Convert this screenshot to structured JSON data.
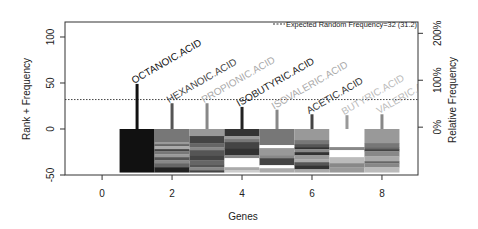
{
  "chart_data": {
    "type": "bar",
    "subtype": "lollipop with striped blocks",
    "title": "",
    "xlabel": "Genes",
    "ylabel": "Rank + Frequency",
    "ylabel_right": "Relative Frequency",
    "xlim": [
      -1.06,
      9.03
    ],
    "ylim": [
      -50,
      116.3
    ],
    "xticks": [
      0,
      2,
      4,
      6,
      8
    ],
    "yticks": [
      -50,
      0,
      50,
      100
    ],
    "yticks_right": [
      {
        "label": "0%",
        "at": 2
      },
      {
        "label": "100%",
        "at": 53
      },
      {
        "label": "200%",
        "at": 104
      }
    ],
    "grid": false,
    "legend_position": "top-right",
    "reference_line": {
      "label": "Expected Random Frequency=32 (31.2)",
      "value": 32,
      "style": "dotted"
    },
    "categories": [
      "OCTANOIC.ACID",
      "HEXANOIC.ACID",
      "PROPIONIC.ACID",
      "ISOBUTYRIC.ACID",
      "ISOVALERIC.ACID",
      "ACETIC.ACID",
      "BUTYRIC.ACID",
      "VALERIC.ACID"
    ],
    "x": [
      1,
      2,
      3,
      4,
      5,
      6,
      7,
      8
    ],
    "values": [
      49,
      28,
      28,
      24,
      21,
      16,
      15,
      16
    ],
    "stick_colors": [
      "#111111",
      "#555555",
      "#888888",
      "#222222",
      "#888888",
      "#444444",
      "#999999",
      "#888888"
    ],
    "label_colors": [
      "#111111",
      "#444444",
      "#aaaaaa",
      "#222222",
      "#aaaaaa",
      "#333333",
      "#bbbbbb",
      "#bbbbbb"
    ],
    "block_bottom": -47,
    "blocks": [
      [
        {
          "color": "#111111",
          "h": 43
        }
      ],
      [
        {
          "color": "#777777",
          "h": 13
        },
        {
          "color": "#999999",
          "h": 2
        },
        {
          "color": "#666666",
          "h": 2
        },
        {
          "color": "#aaaaaa",
          "h": 3
        },
        {
          "color": "#444444",
          "h": 2
        },
        {
          "color": "#777777",
          "h": 3
        },
        {
          "color": "#999999",
          "h": 3
        },
        {
          "color": "#555555",
          "h": 3
        },
        {
          "color": "#888888",
          "h": 3
        },
        {
          "color": "#666666",
          "h": 4
        },
        {
          "color": "#222222",
          "h": 5
        }
      ],
      [
        {
          "color": "#999999",
          "h": 7
        },
        {
          "color": "#444444",
          "h": 7
        },
        {
          "color": "#666666",
          "h": 4
        },
        {
          "color": "#888888",
          "h": 3
        },
        {
          "color": "#555555",
          "h": 5
        },
        {
          "color": "#444444",
          "h": 5
        },
        {
          "color": "#666666",
          "h": 4
        },
        {
          "color": "#555555",
          "h": 3
        },
        {
          "color": "#888888",
          "h": 3
        },
        {
          "color": "#444444",
          "h": 2
        }
      ],
      [
        {
          "color": "#333333",
          "h": 7
        },
        {
          "color": "#999999",
          "h": 3
        },
        {
          "color": "#777777",
          "h": 3
        },
        {
          "color": "#444444",
          "h": 6
        },
        {
          "color": "#333333",
          "h": 7
        },
        {
          "color": "#888888",
          "h": 3
        },
        {
          "color": "#ffffff",
          "h": 9
        },
        {
          "color": "#aaaaaa",
          "h": 3
        },
        {
          "color": "#cccccc",
          "h": 2
        }
      ],
      [
        {
          "color": "#777777",
          "h": 16
        },
        {
          "color": "#ffffff",
          "h": 3
        },
        {
          "color": "#999999",
          "h": 7
        },
        {
          "color": "#888888",
          "h": 3
        },
        {
          "color": "#444444",
          "h": 7
        },
        {
          "color": "#ffffff",
          "h": 3
        },
        {
          "color": "#aaaaaa",
          "h": 4
        }
      ],
      [
        {
          "color": "#999999",
          "h": 11
        },
        {
          "color": "#777777",
          "h": 4
        },
        {
          "color": "#555555",
          "h": 3
        },
        {
          "color": "#333333",
          "h": 2
        },
        {
          "color": "#888888",
          "h": 3
        },
        {
          "color": "#333333",
          "h": 3
        },
        {
          "color": "#999999",
          "h": 4
        },
        {
          "color": "#aaaaaa",
          "h": 3
        },
        {
          "color": "#555555",
          "h": 3
        },
        {
          "color": "#333333",
          "h": 4
        },
        {
          "color": "#aaaaaa",
          "h": 3
        }
      ],
      [
        {
          "color": "#ffffff",
          "h": 18
        },
        {
          "color": "#888888",
          "h": 3
        },
        {
          "color": "#ffffff",
          "h": 7
        },
        {
          "color": "#bbbbbb",
          "h": 6
        },
        {
          "color": "#888888",
          "h": 4
        },
        {
          "color": "#999999",
          "h": 5
        }
      ],
      [
        {
          "color": "#999999",
          "h": 14
        },
        {
          "color": "#777777",
          "h": 4
        },
        {
          "color": "#666666",
          "h": 2
        },
        {
          "color": "#444444",
          "h": 2
        },
        {
          "color": "#888888",
          "h": 5
        },
        {
          "color": "#aaaaaa",
          "h": 5
        },
        {
          "color": "#666666",
          "h": 2
        },
        {
          "color": "#888888",
          "h": 4
        },
        {
          "color": "#bbbbbb",
          "h": 5
        }
      ]
    ]
  }
}
